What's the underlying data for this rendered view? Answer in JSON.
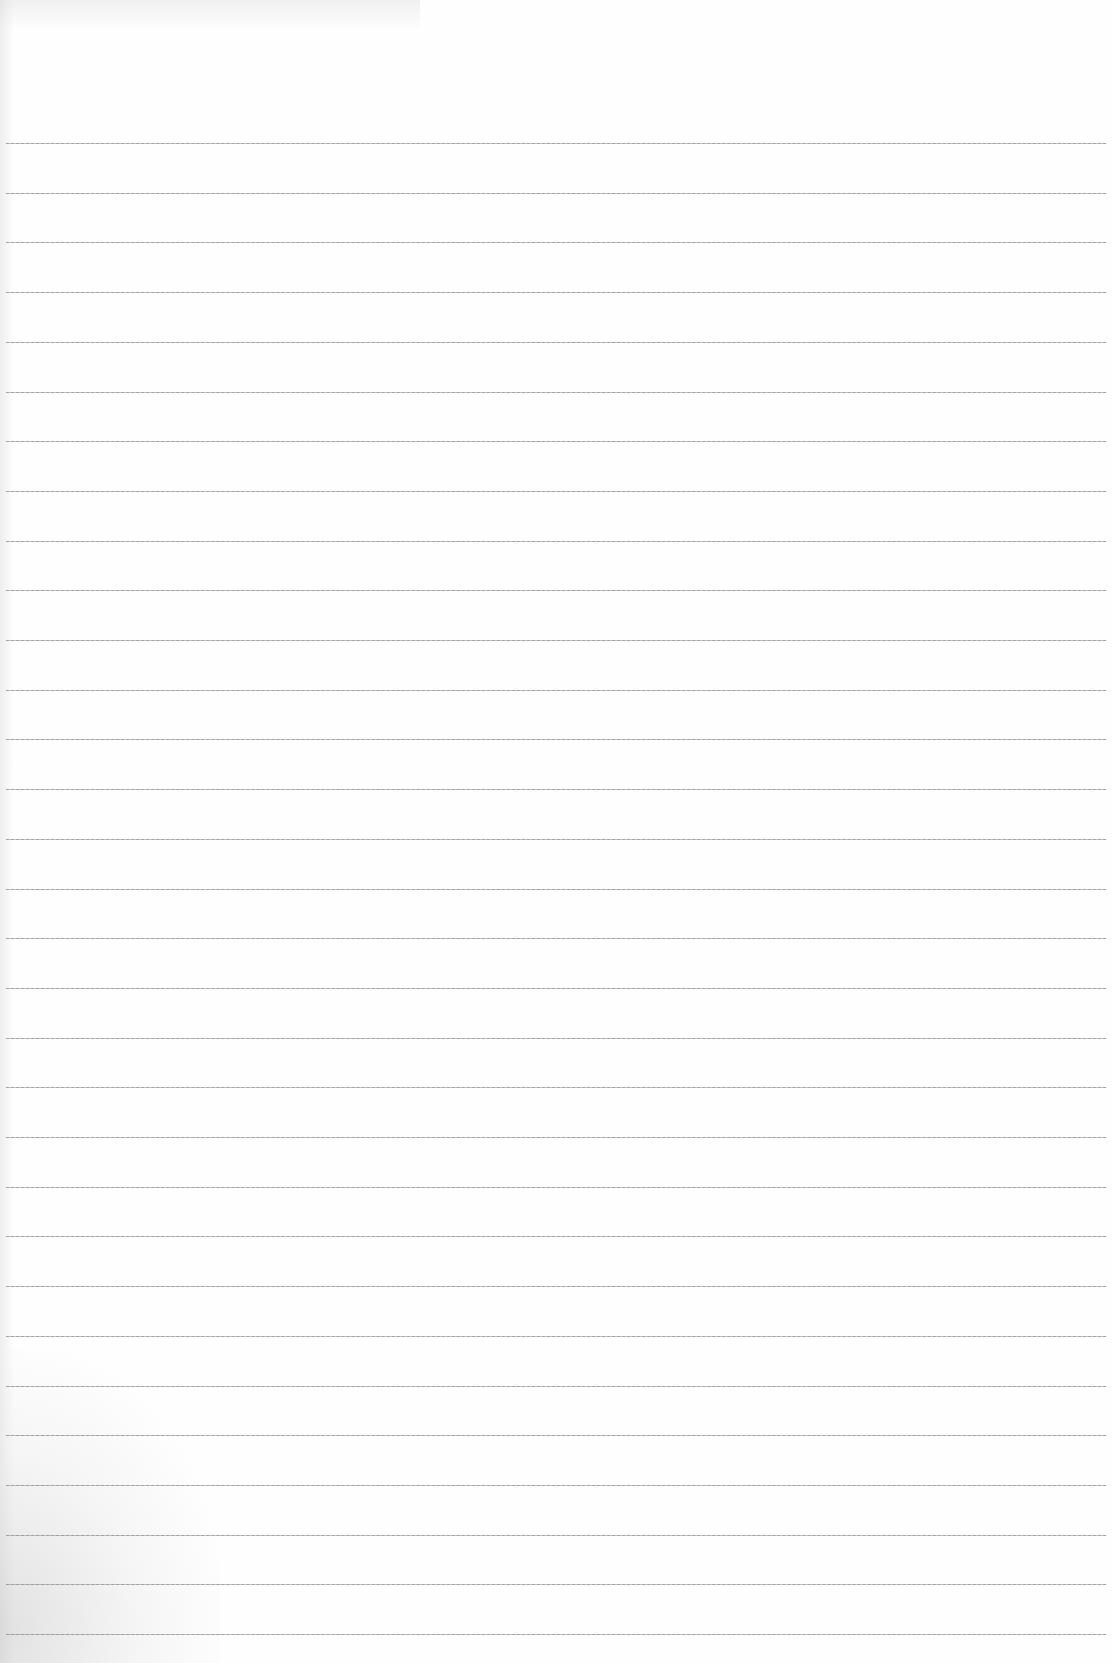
{
  "document": {
    "type": "ruled-notebook-page",
    "background_color": "#fefefe",
    "rule_color": "#9a9a9a",
    "rule_count": 31,
    "first_rule_y": 143,
    "rule_spacing": 49.7,
    "handwritten_text": []
  }
}
